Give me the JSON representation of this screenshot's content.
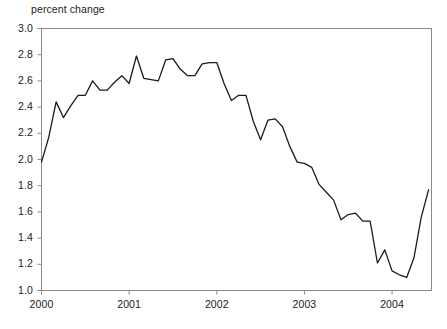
{
  "chart_data": {
    "type": "line",
    "title": "",
    "ylabel": "percent change",
    "xlabel": "",
    "ylim": [
      1.0,
      3.0
    ],
    "xlim": [
      2000.0,
      2004.45
    ],
    "grid": false,
    "legend": null,
    "y_ticks": [
      "3.0",
      "2.8",
      "2.6",
      "2.4",
      "2.2",
      "2.0",
      "1.8",
      "1.6",
      "1.4",
      "1.2",
      "1.0"
    ],
    "y_tick_values": [
      3.0,
      2.8,
      2.6,
      2.4,
      2.2,
      2.0,
      1.8,
      1.6,
      1.4,
      1.2,
      1.0
    ],
    "x_ticks": [
      "2000",
      "2001",
      "2002",
      "2003",
      "2004"
    ],
    "x_tick_values": [
      2000,
      2001,
      2002,
      2003,
      2004
    ],
    "line_color": "#1b1b1b",
    "axis_color": "#8a8a8a",
    "series": [
      {
        "name": "percent change",
        "x": [
          2000.0,
          2000.083,
          2000.167,
          2000.25,
          2000.333,
          2000.417,
          2000.5,
          2000.583,
          2000.667,
          2000.75,
          2000.833,
          2000.917,
          2001.0,
          2001.083,
          2001.167,
          2001.25,
          2001.333,
          2001.417,
          2001.5,
          2001.583,
          2001.667,
          2001.75,
          2001.833,
          2001.917,
          2002.0,
          2002.083,
          2002.167,
          2002.25,
          2002.333,
          2002.417,
          2002.5,
          2002.583,
          2002.667,
          2002.75,
          2002.833,
          2002.917,
          2003.0,
          2003.083,
          2003.167,
          2003.25,
          2003.333,
          2003.417,
          2003.5,
          2003.583,
          2003.667,
          2003.75,
          2003.833,
          2003.917,
          2004.0,
          2004.083,
          2004.167,
          2004.25,
          2004.333,
          2004.417
        ],
        "values": [
          1.98,
          2.17,
          2.44,
          2.32,
          2.41,
          2.49,
          2.49,
          2.6,
          2.53,
          2.53,
          2.59,
          2.64,
          2.58,
          2.79,
          2.62,
          2.61,
          2.6,
          2.76,
          2.77,
          2.69,
          2.64,
          2.64,
          2.73,
          2.74,
          2.74,
          2.58,
          2.45,
          2.49,
          2.49,
          2.29,
          2.15,
          2.3,
          2.31,
          2.25,
          2.1,
          1.98,
          1.97,
          1.94,
          1.81,
          1.75,
          1.69,
          1.54,
          1.58,
          1.59,
          1.53,
          1.53,
          1.21,
          1.31,
          1.15,
          1.12,
          1.1,
          1.25,
          1.56,
          1.77
        ]
      }
    ]
  }
}
